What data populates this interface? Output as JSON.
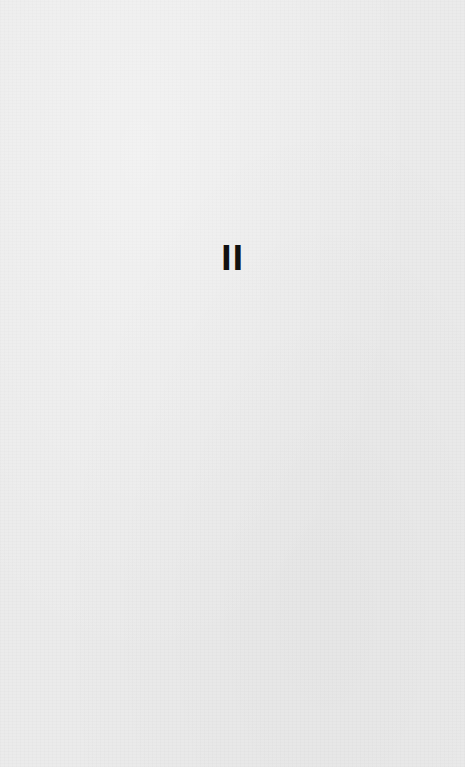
{
  "document": {
    "page_number": "II"
  }
}
